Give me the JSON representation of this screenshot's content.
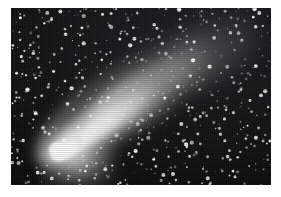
{
  "image": {
    "kind": "astronomical-photograph",
    "subject": "comet",
    "description": "Black-and-white photograph of a bright comet with a luminous nucleus at lower left and a broad fan-shaped dust tail extending diagonally to the upper right across a dense star field.",
    "orientation": "landscape",
    "canvas": {
      "width": 281,
      "height": 197,
      "background_color": "#ffffff"
    },
    "plate": {
      "x": 11,
      "y": 8,
      "width": 260,
      "height": 177,
      "sky_color": "#0d0d0e",
      "border_color": "#ffffff"
    },
    "palette": {
      "sky_dark": "#0d0d0e",
      "sky_mid": "#1c1d20",
      "star_white": "#ffffff",
      "tail_bright": "#fcfcfc",
      "tail_mid": "#d7d7d7",
      "nucleus": "#ffffff"
    },
    "features": [
      {
        "name": "comet-nucleus",
        "label": "Nucleus / coma",
        "x": 56,
        "y": 148,
        "brightness": "brightest"
      },
      {
        "name": "comet-tail",
        "label": "Dust tail",
        "angle_deg": -35,
        "length_px": 215,
        "direction": "lower-left to upper-right"
      },
      {
        "name": "star-field",
        "label": "Star field",
        "coverage": "full frame",
        "density": "dense"
      }
    ],
    "grain": {
      "type": "halftone",
      "visible": true
    }
  },
  "starfield": {
    "seed": 20240517,
    "count": 560,
    "min_radius": 0.35,
    "max_radius": 1.5,
    "color": "#ffffff"
  }
}
